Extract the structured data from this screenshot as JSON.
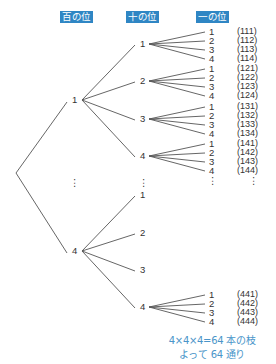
{
  "headers": {
    "hundreds": "百の位",
    "tens": "十の位",
    "ones": "一の位"
  },
  "tree": {
    "level1": [
      {
        "label": "1",
        "expanded": true
      },
      {
        "label": "⋮"
      },
      {
        "label": "4",
        "expanded": true
      }
    ],
    "branches": [
      {
        "parent": "1",
        "tens": [
          {
            "label": "1",
            "ones": [
              "1",
              "2",
              "3",
              "4"
            ],
            "codes": [
              "(111)",
              "(112)",
              "(113)",
              "(114)"
            ]
          },
          {
            "label": "2",
            "ones": [
              "1",
              "2",
              "3",
              "4"
            ],
            "codes": [
              "(121)",
              "(122)",
              "(123)",
              "(124)"
            ]
          },
          {
            "label": "3",
            "ones": [
              "1",
              "2",
              "3",
              "4"
            ],
            "codes": [
              "(131)",
              "(132)",
              "(133)",
              "(134)"
            ]
          },
          {
            "label": "4",
            "ones": [
              "1",
              "2",
              "3",
              "4"
            ],
            "codes": [
              "(141)",
              "(142)",
              "(143)",
              "(144)"
            ]
          }
        ]
      },
      {
        "parent": "4",
        "tens": [
          {
            "label": "1"
          },
          {
            "label": "2"
          },
          {
            "label": "3"
          },
          {
            "label": "4",
            "ones": [
              "1",
              "2",
              "3",
              "4"
            ],
            "codes": [
              "(441)",
              "(442)",
              "(443)",
              "(444)"
            ]
          }
        ]
      }
    ],
    "ellipsis": "⋮"
  },
  "caption": {
    "line1": "4×4×4=64 本の枝",
    "line2": "よって 64 通り"
  },
  "colors": {
    "header_bg": "#2f86c4",
    "caption": "#4a95c9",
    "line": "#555555"
  }
}
